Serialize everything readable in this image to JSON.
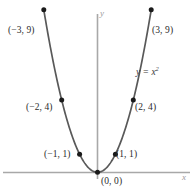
{
  "figure": {
    "equation_label": "y = x",
    "equation_exponent": "2",
    "axis_labels": {
      "x": "x",
      "y": "y"
    },
    "colors": {
      "curve": "#595959",
      "axis": "#a0a0a0",
      "point": "#1a1a1a",
      "label_text": "#2b2b2b",
      "axis_label_text": "#9b9b9b",
      "background": "#ffffff"
    }
  },
  "chart_data": {
    "type": "line",
    "title": "",
    "subtitle": "",
    "xlabel": "x",
    "ylabel": "y",
    "equation": "y = x^2",
    "grid": false,
    "legend": null,
    "xlim": [
      -3.4,
      3.4
    ],
    "ylim": [
      -0.8,
      10.4
    ],
    "x": [
      -3,
      -2,
      -1,
      0,
      1,
      2,
      3
    ],
    "values": [
      9,
      4,
      1,
      0,
      1,
      4,
      9
    ],
    "series": [
      {
        "name": "y = x^2",
        "values": [
          9,
          4,
          1,
          0,
          1,
          4,
          9
        ]
      }
    ],
    "points": [
      {
        "label": "(−3, 9)",
        "x": -3,
        "y": 9
      },
      {
        "label": "(−2, 4)",
        "x": -2,
        "y": 4
      },
      {
        "label": "(−1, 1)",
        "x": -1,
        "y": 1
      },
      {
        "label": "(0, 0)",
        "x": 0,
        "y": 0
      },
      {
        "label": "(1, 1)",
        "x": 1,
        "y": 1
      },
      {
        "label": "(2, 4)",
        "x": 2,
        "y": 4
      },
      {
        "label": "(3, 9)",
        "x": 3,
        "y": 9
      }
    ],
    "annotations": [
      {
        "text": "y = x²",
        "x": 2.45,
        "y": 6.2
      }
    ],
    "xticks": [],
    "yticks": []
  },
  "labels": {
    "p_neg3_9": "(−3, 9)",
    "p_pos3_9": "(3, 9)",
    "p_neg2_4": "(−2, 4)",
    "p_pos2_4": "(2, 4)",
    "p_neg1_1": "(−1, 1)",
    "p_pos1_1": "(1, 1)",
    "p_origin": "(0, 0)"
  }
}
